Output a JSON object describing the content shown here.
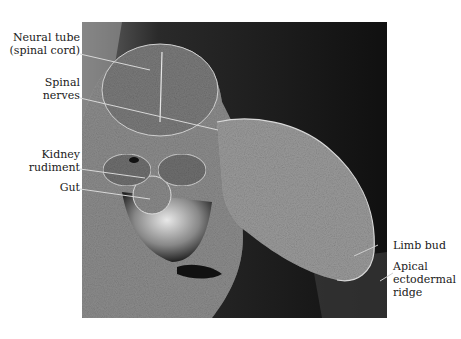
{
  "figure": {
    "type": "scanning electron micrograph",
    "labels": {
      "neural_tube": {
        "line1": "Neural tube",
        "line2": "(spinal cord)"
      },
      "spinal_nerves": {
        "line1": "Spinal",
        "line2": "nerves"
      },
      "kidney_rudiment": {
        "line1": "Kidney",
        "line2": "rudiment"
      },
      "gut": {
        "line1": "Gut"
      },
      "limb_bud": {
        "line1": "Limb bud"
      },
      "apical_ectodermal_ridge": {
        "line1": "Apical",
        "line2": "ectodermal",
        "line3": "ridge"
      }
    }
  }
}
